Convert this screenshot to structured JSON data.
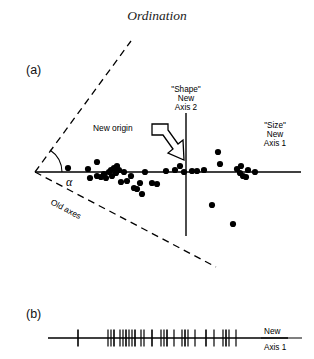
{
  "figure": {
    "title": "Ordination",
    "panels": [
      {
        "id": "a",
        "label": "(a)"
      },
      {
        "id": "b",
        "label": "(b)"
      }
    ]
  },
  "panel_a": {
    "axis2_label_lines": [
      "\"Shape\"",
      "New",
      "Axis 2"
    ],
    "axis1_label_lines": [
      "\"Size\"",
      "New",
      "Axis 1"
    ],
    "new_origin_label": "New origin",
    "old_axes_label": "Old  axes",
    "angle_symbol": "α"
  },
  "panel_b": {
    "axis1_label_lines": [
      "New",
      "Axis 1"
    ]
  },
  "colors": {
    "ink": "#000000",
    "background": "#ffffff",
    "title_ink": "#1a1a1a"
  },
  "chart_data": {
    "type": "scatter",
    "title": "Ordination",
    "xlabel": "\"Size\" New Axis 1",
    "ylabel": "\"Shape\" New Axis 2",
    "grid": false,
    "legend": false,
    "axes_geometry": {
      "new_axis_1": {
        "x_start": 35,
        "x_end": 301,
        "y": 172
      },
      "new_axis_2": {
        "x": 186,
        "y_start": 113,
        "y_end": 236
      },
      "old_axis_upper_dashed": {
        "x1": 35,
        "y1": 172,
        "x2": 131,
        "y2": 41
      },
      "old_axis_lower_dashed": {
        "x1": 35,
        "y1": 172,
        "x2": 216,
        "y2": 267
      },
      "angle_arc_center": {
        "x": 35,
        "y": 172
      }
    },
    "points": [
      {
        "x": 68,
        "y": 168
      },
      {
        "x": 88,
        "y": 169
      },
      {
        "x": 90,
        "y": 178
      },
      {
        "x": 97,
        "y": 162
      },
      {
        "x": 97,
        "y": 176
      },
      {
        "x": 101,
        "y": 177
      },
      {
        "x": 104,
        "y": 174
      },
      {
        "x": 106,
        "y": 178
      },
      {
        "x": 109,
        "y": 172
      },
      {
        "x": 111,
        "y": 170
      },
      {
        "x": 112,
        "y": 176
      },
      {
        "x": 114,
        "y": 168
      },
      {
        "x": 116,
        "y": 173
      },
      {
        "x": 117,
        "y": 166
      },
      {
        "x": 119,
        "y": 170
      },
      {
        "x": 121,
        "y": 182
      },
      {
        "x": 124,
        "y": 172
      },
      {
        "x": 127,
        "y": 181
      },
      {
        "x": 131,
        "y": 176
      },
      {
        "x": 134,
        "y": 188
      },
      {
        "x": 137,
        "y": 189
      },
      {
        "x": 140,
        "y": 183
      },
      {
        "x": 142,
        "y": 194
      },
      {
        "x": 145,
        "y": 172
      },
      {
        "x": 152,
        "y": 183
      },
      {
        "x": 157,
        "y": 184
      },
      {
        "x": 166,
        "y": 171
      },
      {
        "x": 175,
        "y": 170
      },
      {
        "x": 180,
        "y": 166
      },
      {
        "x": 184,
        "y": 172
      },
      {
        "x": 192,
        "y": 171
      },
      {
        "x": 197,
        "y": 171
      },
      {
        "x": 204,
        "y": 170
      },
      {
        "x": 218,
        "y": 152
      },
      {
        "x": 220,
        "y": 164
      },
      {
        "x": 237,
        "y": 169
      },
      {
        "x": 240,
        "y": 173
      },
      {
        "x": 241,
        "y": 166
      },
      {
        "x": 243,
        "y": 176
      },
      {
        "x": 246,
        "y": 177
      },
      {
        "x": 248,
        "y": 170
      },
      {
        "x": 255,
        "y": 172
      },
      {
        "x": 212,
        "y": 205
      },
      {
        "x": 233,
        "y": 224
      }
    ],
    "panel_b_rug": {
      "type": "rug",
      "baseline_y": 338,
      "x_start": 48,
      "x_end": 288,
      "tick_positions": [
        78,
        108,
        111,
        114,
        120,
        123,
        126,
        129,
        132,
        135,
        141,
        144,
        152,
        161,
        164,
        167,
        174,
        182,
        185,
        188,
        195,
        206,
        214,
        223,
        226,
        229,
        236
      ]
    }
  }
}
